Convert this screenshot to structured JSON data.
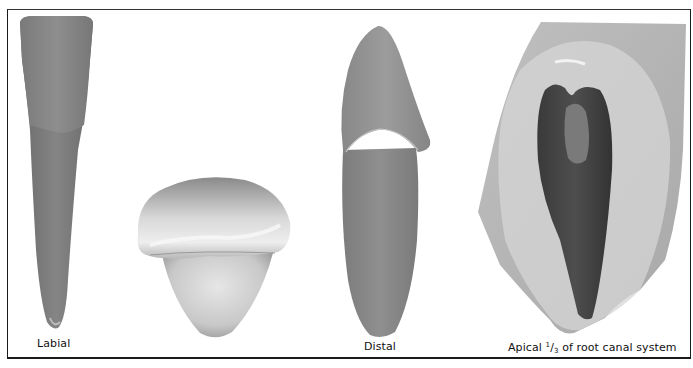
{
  "figure": {
    "panels": [
      {
        "id": "labial",
        "caption": "Labial",
        "subject": "tooth-labial-view"
      },
      {
        "id": "incisal",
        "caption": "",
        "subject": "tooth-incisal-view"
      },
      {
        "id": "distal",
        "caption": "Distal",
        "subject": "tooth-distal-view"
      },
      {
        "id": "apical",
        "caption_prefix": "Apical ",
        "caption_numerator": "1",
        "caption_slash": "/",
        "caption_denominator": "3",
        "caption_suffix": " of root canal system",
        "subject": "root-canal-section"
      }
    ]
  }
}
